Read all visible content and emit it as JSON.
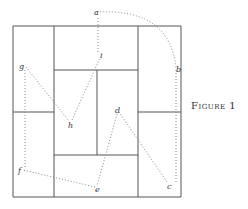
{
  "figure": {
    "caption": "Figure 1"
  },
  "points": [
    {
      "label": "a",
      "x": 97,
      "y": 12
    },
    {
      "label": "b",
      "x": 176,
      "y": 68
    },
    {
      "label": "c",
      "x": 169,
      "y": 186
    },
    {
      "label": "d",
      "x": 117,
      "y": 110
    },
    {
      "label": "e",
      "x": 97,
      "y": 189
    },
    {
      "label": "f",
      "x": 20,
      "y": 170
    },
    {
      "label": "g",
      "x": 21,
      "y": 66
    },
    {
      "label": "h",
      "x": 70,
      "y": 125
    },
    {
      "label": "i",
      "x": 101,
      "y": 55
    }
  ],
  "colors": {
    "grid": "#555555",
    "path": "#888888",
    "text": "#333333"
  }
}
